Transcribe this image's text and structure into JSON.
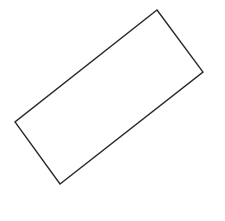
{
  "canvas": {
    "width": 225,
    "height": 221,
    "background": "#ffffff"
  },
  "shapes": [
    {
      "type": "rectangle",
      "rotated": true,
      "points": "157,10 203,72 60,184 15,122",
      "stroke": "#2a2a2a",
      "stroke_width": 1.4,
      "fill": "none"
    }
  ]
}
